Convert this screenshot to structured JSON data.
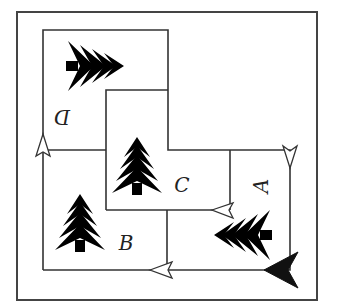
{
  "diagram": {
    "type": "map-route-puzzle",
    "regions": [
      {
        "id": "A",
        "label": "A",
        "orientation": "rotated-90-cw",
        "has_tree": true,
        "tree_orientation": "pointing-left"
      },
      {
        "id": "B",
        "label": "B",
        "orientation": "upright",
        "has_tree": true,
        "tree_orientation": "upright"
      },
      {
        "id": "C",
        "label": "C",
        "orientation": "upright",
        "has_tree": true,
        "tree_orientation": "upright"
      },
      {
        "id": "D",
        "label": "D",
        "orientation": "rotated-180",
        "has_tree": true,
        "tree_orientation": "pointing-right"
      }
    ],
    "arrows": [
      {
        "name": "start-arrow",
        "style": "filled",
        "position": "bottom-right",
        "direction": "left"
      },
      {
        "name": "arrow-bottom-path",
        "style": "open",
        "position": "bottom-middle",
        "direction": "left"
      },
      {
        "name": "arrow-left-path",
        "style": "open",
        "position": "left-middle",
        "direction": "up"
      },
      {
        "name": "arrow-right-path",
        "style": "open",
        "position": "right-middle",
        "direction": "down"
      },
      {
        "name": "arrow-c-bottom",
        "style": "open",
        "position": "between-C-and-A",
        "direction": "left"
      }
    ],
    "colors": {
      "line": "#333333",
      "background": "#ffffff",
      "start_arrow": "#111111"
    }
  }
}
